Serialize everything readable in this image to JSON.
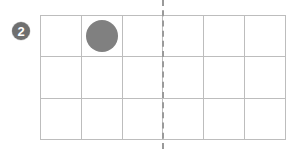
{
  "page": {
    "background_color": "#ffffff",
    "width": 294,
    "height": 149
  },
  "question": {
    "badge_number": "2",
    "badge_color": "#6f6f6f",
    "badge_text_color": "#ffffff"
  },
  "grid": {
    "columns": 6,
    "rows": 3,
    "line_color": "#bdbdbd",
    "cells": [
      {
        "row": 1,
        "col": 1,
        "token": false
      },
      {
        "row": 1,
        "col": 2,
        "token": true
      },
      {
        "row": 1,
        "col": 3,
        "token": false
      },
      {
        "row": 1,
        "col": 4,
        "token": false
      },
      {
        "row": 1,
        "col": 5,
        "token": false
      },
      {
        "row": 1,
        "col": 6,
        "token": false
      },
      {
        "row": 2,
        "col": 1,
        "token": false
      },
      {
        "row": 2,
        "col": 2,
        "token": false
      },
      {
        "row": 2,
        "col": 3,
        "token": false
      },
      {
        "row": 2,
        "col": 4,
        "token": false
      },
      {
        "row": 2,
        "col": 5,
        "token": false
      },
      {
        "row": 2,
        "col": 6,
        "token": false
      },
      {
        "row": 3,
        "col": 1,
        "token": false
      },
      {
        "row": 3,
        "col": 2,
        "token": false
      },
      {
        "row": 3,
        "col": 3,
        "token": false
      },
      {
        "row": 3,
        "col": 4,
        "token": false
      },
      {
        "row": 3,
        "col": 5,
        "token": false
      },
      {
        "row": 3,
        "col": 6,
        "token": false
      }
    ]
  },
  "token": {
    "shape": "circle",
    "color": "#808080",
    "count": 1
  },
  "divider": {
    "orientation": "vertical",
    "style": "dashed",
    "color": "#9a9a9a",
    "after_column": 3
  }
}
